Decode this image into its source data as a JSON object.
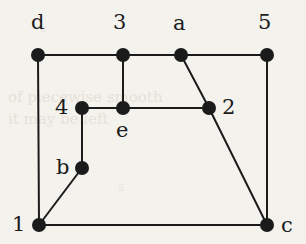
{
  "figure": {
    "kind": "planar-graph-diagram",
    "background_color": "#f4f2ec",
    "ink_color": "#1b1b1b",
    "width": 306,
    "height": 244
  },
  "graph": {
    "node_radius": 7,
    "edge_width": 2,
    "nodes": [
      {
        "id": "d",
        "label": "d",
        "x": 38,
        "y": 55,
        "label_x": 31,
        "label_y": 12
      },
      {
        "id": "3",
        "label": "3",
        "x": 123,
        "y": 55,
        "label_x": 113,
        "label_y": 12
      },
      {
        "id": "a",
        "label": "a",
        "x": 181,
        "y": 55,
        "label_x": 173,
        "label_y": 13
      },
      {
        "id": "5",
        "label": "5",
        "x": 267,
        "y": 55,
        "label_x": 258,
        "label_y": 12
      },
      {
        "id": "4",
        "label": "4",
        "x": 82,
        "y": 108,
        "label_x": 55,
        "label_y": 97
      },
      {
        "id": "e",
        "label": "e",
        "x": 123,
        "y": 108,
        "label_x": 116,
        "label_y": 120
      },
      {
        "id": "2",
        "label": "2",
        "x": 209,
        "y": 108,
        "label_x": 222,
        "label_y": 97
      },
      {
        "id": "b",
        "label": "b",
        "x": 82,
        "y": 168,
        "label_x": 56,
        "label_y": 157
      },
      {
        "id": "1",
        "label": "1",
        "x": 39,
        "y": 225,
        "label_x": 12,
        "label_y": 214
      },
      {
        "id": "c",
        "label": "c",
        "x": 267,
        "y": 225,
        "label_x": 281,
        "label_y": 215
      }
    ],
    "edges": [
      {
        "from": "d",
        "to": "3"
      },
      {
        "from": "3",
        "to": "a"
      },
      {
        "from": "a",
        "to": "5"
      },
      {
        "from": "d",
        "to": "1"
      },
      {
        "from": "5",
        "to": "c"
      },
      {
        "from": "3",
        "to": "e"
      },
      {
        "from": "4",
        "to": "e"
      },
      {
        "from": "e",
        "to": "2"
      },
      {
        "from": "4",
        "to": "b"
      },
      {
        "from": "b",
        "to": "1"
      },
      {
        "from": "a",
        "to": "2"
      },
      {
        "from": "2",
        "to": "c"
      },
      {
        "from": "1",
        "to": "c"
      }
    ]
  },
  "scan_artifacts": [
    {
      "text": "of piecewise smooth",
      "x": 8,
      "y": 88,
      "size": 15,
      "opacity": 0.55
    },
    {
      "text": "it may be left",
      "x": 8,
      "y": 110,
      "size": 15,
      "opacity": 0.5
    },
    {
      "text": "e",
      "x": 40,
      "y": 22,
      "size": 11,
      "opacity": 0.45
    },
    {
      "text": "s",
      "x": 118,
      "y": 180,
      "size": 12,
      "opacity": 0.4
    }
  ]
}
